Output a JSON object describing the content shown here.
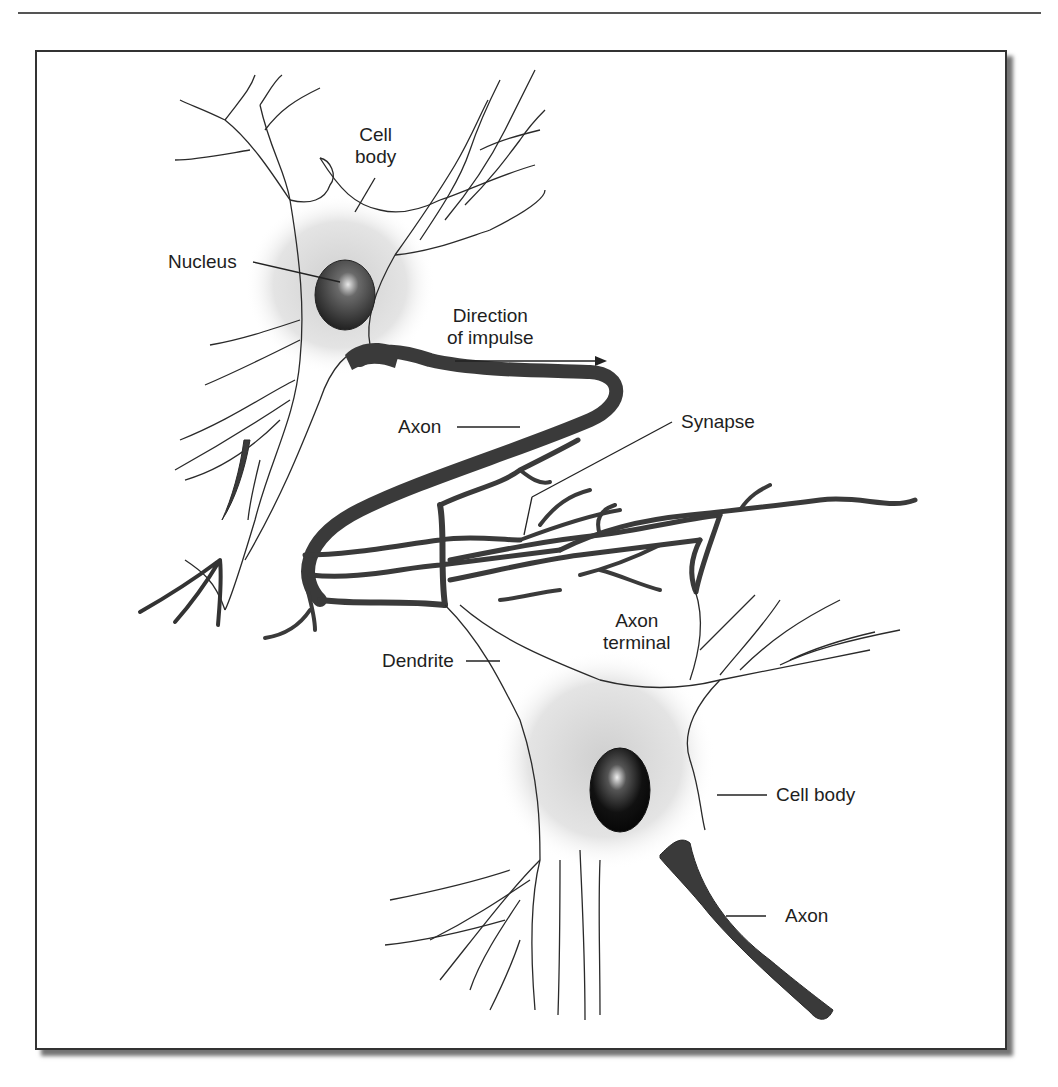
{
  "figure": {
    "type": "neuron-diagram",
    "colors": {
      "outline": "#2a2a2a",
      "axon_fill": "#3a3a3a",
      "cell_body_shade": "#d4d4d4",
      "nucleus": "#1a1a1a",
      "frame_border": "#333333"
    }
  },
  "labels": {
    "cell_body_top": "Cell\nbody",
    "nucleus": "Nucleus",
    "direction": "Direction\nof impulse",
    "axon_top": "Axon",
    "synapse": "Synapse",
    "axon_terminal": "Axon\nterminal",
    "dendrite": "Dendrite",
    "cell_body_bottom": "Cell body",
    "axon_bottom": "Axon"
  }
}
